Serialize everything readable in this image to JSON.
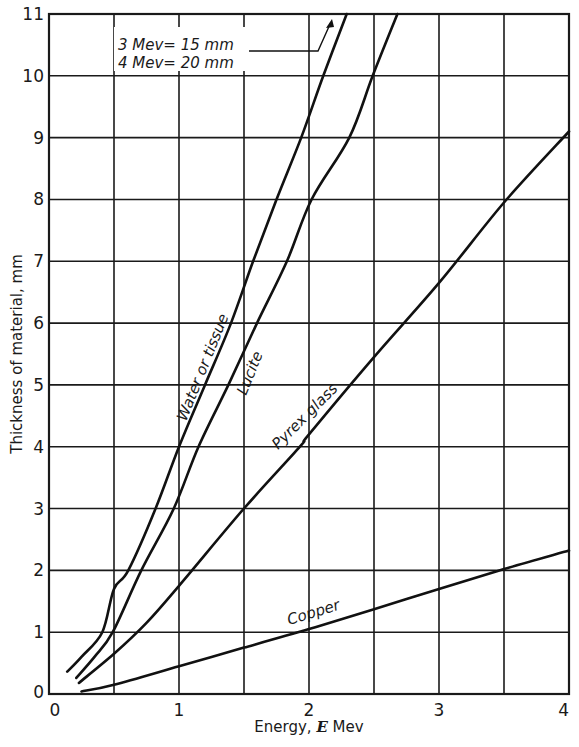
{
  "chart_data": {
    "type": "line",
    "title": "",
    "xlabel": "Energy, E Mev",
    "xlabel_parts": {
      "prefix": "Energy, ",
      "symbol": "E",
      "suffix": " Mev"
    },
    "ylabel": "Thickness of material, mm",
    "xlim": [
      0,
      4
    ],
    "ylim": [
      0,
      11
    ],
    "grid": true,
    "x_gridlines": [
      0.5,
      1,
      1.5,
      2,
      2.5,
      3,
      3.5
    ],
    "y_gridlines": [
      1,
      2,
      3,
      4,
      5,
      6,
      7,
      8,
      9,
      10
    ],
    "x_ticks": [
      "0",
      "1",
      "2",
      "3",
      "4"
    ],
    "x_tick_values": [
      0,
      1,
      2,
      3,
      4
    ],
    "y_ticks": [
      "0",
      "1",
      "2",
      "3",
      "4",
      "5",
      "6",
      "7",
      "8",
      "9",
      "10",
      "11"
    ],
    "y_tick_values": [
      0,
      1,
      2,
      3,
      4,
      5,
      6,
      7,
      8,
      9,
      10,
      11
    ],
    "legend_position": "inline labels on curves",
    "series": [
      {
        "name": "Water or tissue",
        "x": [
          0.14,
          0.25,
          0.41,
          0.5,
          0.61,
          0.82,
          1.0,
          1.2,
          1.4,
          1.57,
          1.75,
          1.94,
          2.11,
          2.29
        ],
        "y": [
          0.36,
          0.6,
          1.0,
          1.7,
          2.0,
          3.0,
          4.0,
          5.0,
          6.0,
          7.0,
          8.0,
          9.0,
          10.0,
          11.0
        ]
      },
      {
        "name": "Lucite",
        "x": [
          0.21,
          0.35,
          0.49,
          0.71,
          0.96,
          1.15,
          1.38,
          1.6,
          1.83,
          2.02,
          2.31,
          2.49,
          2.68
        ],
        "y": [
          0.26,
          0.6,
          1.0,
          2.0,
          3.0,
          4.0,
          5.0,
          6.0,
          7.0,
          8.0,
          9.0,
          10.0,
          11.0
        ]
      },
      {
        "name": "Pyrex glass",
        "x": [
          0.23,
          0.5,
          0.75,
          1.0,
          1.5,
          1.93,
          2.0,
          2.5,
          3.0,
          3.5,
          4.0
        ],
        "y": [
          0.18,
          0.65,
          1.15,
          1.75,
          3.0,
          4.0,
          4.2,
          5.45,
          6.65,
          7.95,
          9.1
        ]
      },
      {
        "name": "Copper",
        "x": [
          0.25,
          0.5,
          1.0,
          1.5,
          2.0,
          2.5,
          3.0,
          3.5,
          4.0
        ],
        "y": [
          0.04,
          0.15,
          0.45,
          0.75,
          1.05,
          1.37,
          1.7,
          2.02,
          2.32
        ]
      }
    ],
    "annotations": [
      {
        "text": "3 Mev = 15 mm",
        "note": "Water or tissue beyond plot range (arrow)"
      },
      {
        "text": "4 Mev = 20 mm",
        "note": "Water or tissue beyond plot range"
      }
    ]
  },
  "labels": {
    "water": "Water or tissue",
    "lucite": "Lucite",
    "pyrex": "Pyrex glass",
    "copper": "Copper",
    "note_line1": "3 Mev= 15 mm",
    "note_line2": "4 Mev= 20 mm",
    "origin_y": "0"
  },
  "colors": {
    "ink": "#111111",
    "background": "#ffffff"
  }
}
